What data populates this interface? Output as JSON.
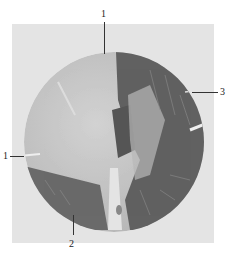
{
  "figure": {
    "colors": {
      "background": "#ffffff",
      "plate": "#e4e4e4",
      "light_tissue": "#c8c8c8",
      "dark_tissue": "#5a5a5a",
      "label": "#222222"
    },
    "labels": [
      {
        "id": "top",
        "text": "1"
      },
      {
        "id": "left",
        "text": "1"
      },
      {
        "id": "bottom",
        "text": "2"
      },
      {
        "id": "right",
        "text": "3"
      }
    ]
  }
}
